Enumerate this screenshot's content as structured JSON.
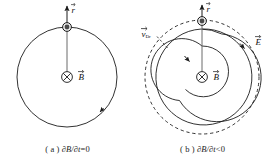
{
  "figure": {
    "type": "physics-diagram",
    "background_color": "#ffffff",
    "line_color": "#1c1c1c",
    "particle_color": "#4a4a4a"
  },
  "panels": [
    {
      "id": "a",
      "caption": {
        "index": "( a )",
        "expression": "∂B/∂t",
        "relation": "=0",
        "full": "( a ) ∂B/∂t=0"
      },
      "labels": {
        "radius_vector": "r",
        "magnetic_field": "B"
      },
      "elements": {
        "orbit_circle": {
          "style": "solid",
          "radius_px": 50,
          "center": [
            67,
            77
          ]
        },
        "field_symbol": "⊗",
        "particle": {
          "shape": "filled-circle",
          "position": "top-of-orbit"
        },
        "direction_arrow": {
          "on": "orbit_circle",
          "sense": "clockwise"
        }
      }
    },
    {
      "id": "b",
      "caption": {
        "index": "( b )",
        "expression": "∂B/∂t",
        "relation": "<0",
        "full": "( b ) ∂B/∂t<0"
      },
      "labels": {
        "radius_vector": "r",
        "magnetic_field": "B",
        "induced_electric_field": "E",
        "drift_velocity": "v",
        "drift_velocity_subscript": "Dr"
      },
      "elements": {
        "outer_circle": {
          "style": "dashed",
          "radius_px": 57,
          "center": [
            67,
            77
          ]
        },
        "spiral": {
          "style": "solid",
          "turns": 2,
          "sense": "inward"
        },
        "field_symbol": "⊗",
        "particle": {
          "shape": "filled-circle",
          "position": "top-of-outer-circle"
        },
        "direction_arrow": {
          "on": "spiral",
          "sense": "inward-clockwise"
        },
        "e_field_arrow": {
          "on": "outer_circle",
          "sense": "clockwise"
        }
      }
    }
  ]
}
